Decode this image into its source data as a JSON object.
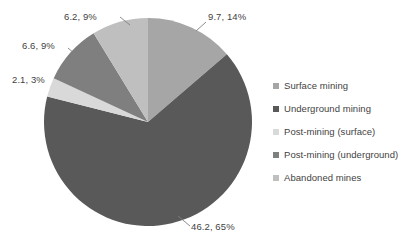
{
  "chart_data": {
    "type": "pie",
    "title": "",
    "legend_position": "right",
    "grid": false,
    "labels": [
      "Surface mining",
      "Underground mining",
      "Post-mining (surface)",
      "Post-mining (underground)",
      "Abandoned mines"
    ],
    "values": [
      9.7,
      46.2,
      2.1,
      6.6,
      6.2
    ],
    "percentages": [
      14,
      65,
      3,
      9,
      9
    ],
    "colors": [
      "#a6a6a6",
      "#595959",
      "#d9d9d9",
      "#7f7f7f",
      "#bfbfbf"
    ],
    "slices": [
      {
        "label": "Surface mining",
        "value": 9.7,
        "percent": 14,
        "data_label": "9.7, 14%",
        "color": "#a6a6a6"
      },
      {
        "label": "Underground mining",
        "value": 46.2,
        "percent": 65,
        "data_label": "46.2, 65%",
        "color": "#595959"
      },
      {
        "label": "Post-mining (surface)",
        "value": 2.1,
        "percent": 3,
        "data_label": "2.1, 3%",
        "color": "#d9d9d9"
      },
      {
        "label": "Post-mining (underground)",
        "value": 6.6,
        "percent": 9,
        "data_label": "6.6, 9%",
        "color": "#7f7f7f"
      },
      {
        "label": "Abandoned mines",
        "value": 6.2,
        "percent": 9,
        "data_label": "6.2, 9%",
        "color": "#bfbfbf"
      }
    ]
  },
  "data_labels": {
    "top_left": "6.2, 9%",
    "top_right": "9.7, 14%",
    "left_upper": "6.6, 9%",
    "left_lower": "2.1, 3%",
    "bottom": "46.2, 65%"
  },
  "legend": {
    "items": [
      {
        "label": "Surface mining",
        "color": "#a6a6a6"
      },
      {
        "label": "Underground mining",
        "color": "#595959"
      },
      {
        "label": "Post-mining (surface)",
        "color": "#d9d9d9"
      },
      {
        "label": "Post-mining (underground)",
        "color": "#7f7f7f"
      },
      {
        "label": "Abandoned mines",
        "color": "#bfbfbf"
      }
    ]
  }
}
